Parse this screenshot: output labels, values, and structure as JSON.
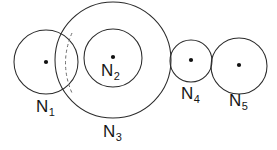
{
  "diagram": {
    "type": "circle-packing-venn",
    "title": "",
    "background_color": "#ffffff",
    "stroke_color": "#2b2b2b",
    "dashed_stroke_color": "#6e6e6e",
    "dot_color": "#111111",
    "nodes": [
      {
        "id": "n1",
        "label_base": "N",
        "label_sub": "1",
        "cx": 46,
        "cy": 62,
        "r": 32,
        "has_center_dot": true,
        "has_dashed_chord": true,
        "stroke_style": "solid"
      },
      {
        "id": "n2",
        "label_base": "N",
        "label_sub": "2",
        "cx": 113,
        "cy": 58,
        "r": 29,
        "has_center_dot": true,
        "has_dashed_chord": false,
        "stroke_style": "solid"
      },
      {
        "id": "n3",
        "label_base": "N",
        "label_sub": "3",
        "cx": 113,
        "cy": 60,
        "r": 58,
        "has_center_dot": false,
        "has_dashed_chord": false,
        "stroke_style": "solid"
      },
      {
        "id": "n4",
        "label_base": "N",
        "label_sub": "4",
        "cx": 191,
        "cy": 61,
        "r": 21,
        "has_center_dot": true,
        "has_dashed_chord": false,
        "stroke_style": "solid"
      },
      {
        "id": "n5",
        "label_base": "N",
        "label_sub": "5",
        "cx": 239,
        "cy": 66,
        "r": 28,
        "has_center_dot": true,
        "has_dashed_chord": false,
        "stroke_style": "solid"
      }
    ],
    "dashed_chord": {
      "start_x": 72,
      "start_y": 33,
      "control_x": 59,
      "control_y": 63,
      "end_x": 72,
      "end_y": 93
    }
  }
}
